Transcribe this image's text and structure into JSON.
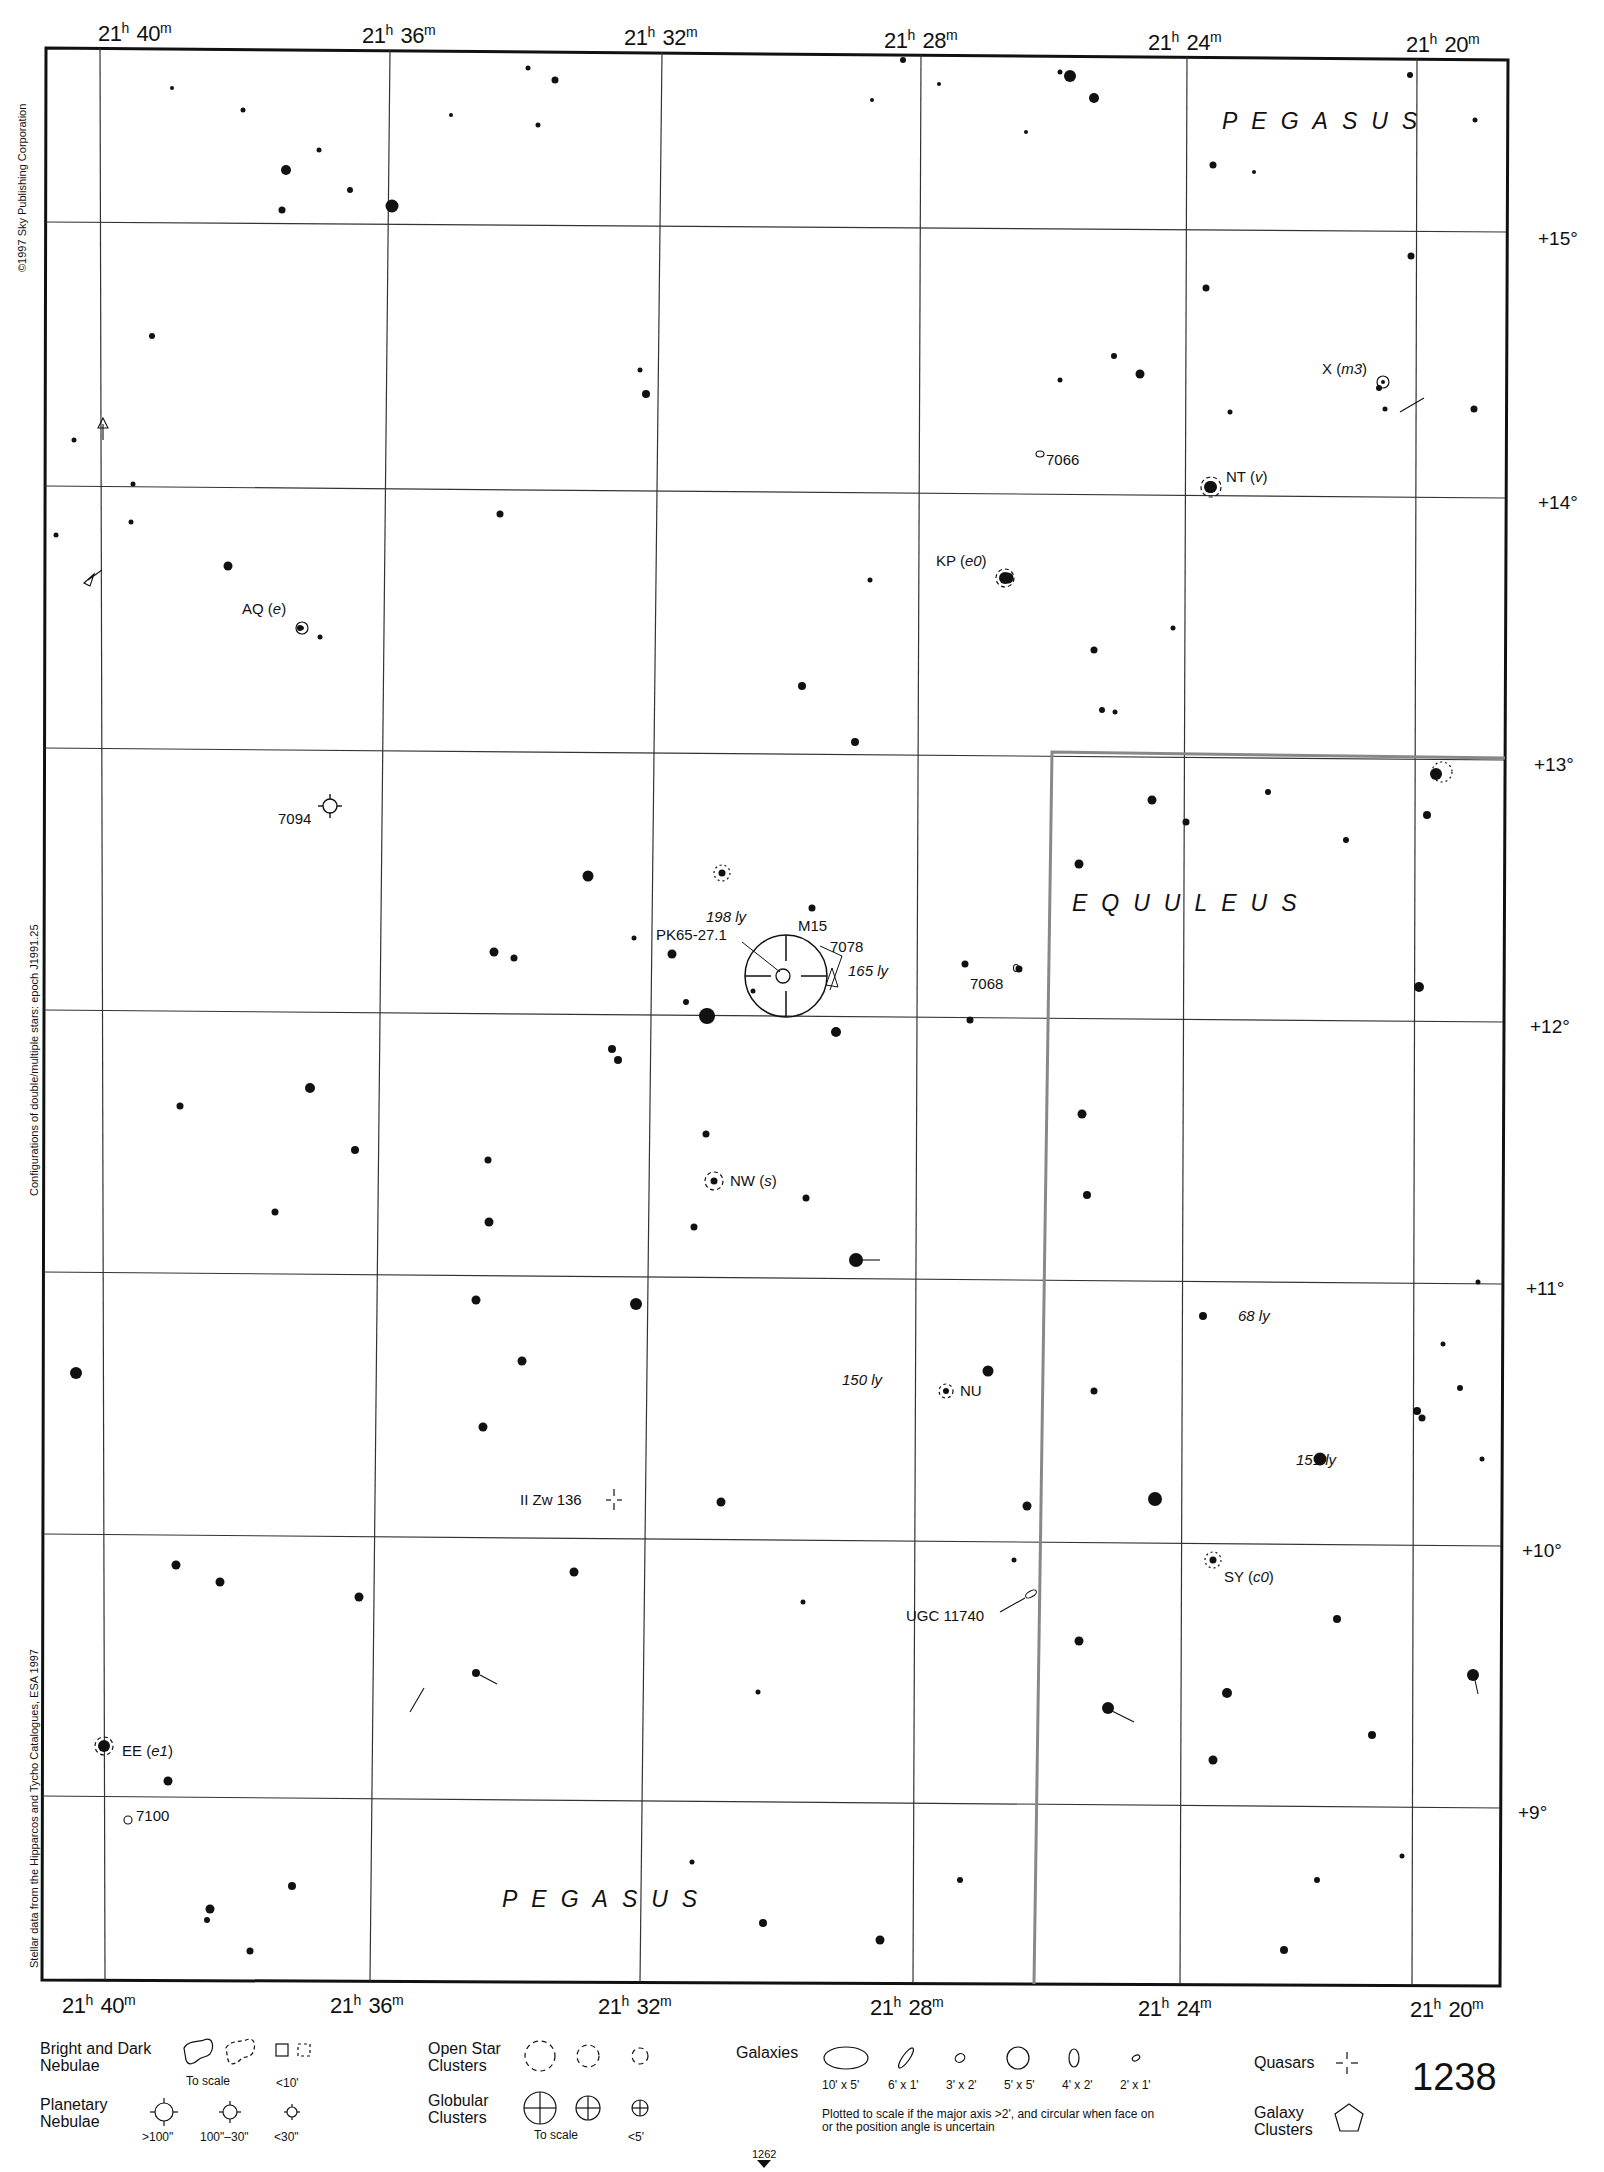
{
  "chart": {
    "page_number": "1238",
    "adjacent_page_bottom": "1262",
    "ra_labels_top": [
      {
        "h": "21",
        "m": "40",
        "x": 98
      },
      {
        "h": "21",
        "m": "36",
        "x": 362
      },
      {
        "h": "21",
        "m": "32",
        "x": 624
      },
      {
        "h": "21",
        "m": "28",
        "x": 884
      },
      {
        "h": "21",
        "m": "24",
        "x": 1148
      },
      {
        "h": "21",
        "m": "20",
        "x": 1406
      }
    ],
    "ra_labels_bottom": [
      {
        "h": "21",
        "m": "40",
        "x": 62
      },
      {
        "h": "21",
        "m": "36",
        "x": 330
      },
      {
        "h": "21",
        "m": "32",
        "x": 598
      },
      {
        "h": "21",
        "m": "28",
        "x": 870
      },
      {
        "h": "21",
        "m": "24",
        "x": 1138
      },
      {
        "h": "21",
        "m": "20",
        "x": 1410
      }
    ],
    "dec_labels": [
      {
        "text": "+15°",
        "y": 228
      },
      {
        "text": "+14°",
        "y": 492
      },
      {
        "text": "+13°",
        "y": 754
      },
      {
        "text": "+12°",
        "y": 1016
      },
      {
        "text": "+11°",
        "y": 1278
      },
      {
        "text": "+10°",
        "y": 1540
      },
      {
        "text": "+9°",
        "y": 1802
      }
    ],
    "side_notes": {
      "copyright": "©1997 Sky Publishing Corporation",
      "configurations": "Configurations of double/multiple stars: epoch J1991.25",
      "stellar_data": "Stellar data from the Hipparcos and Tycho Catalogues, ESA 1997"
    },
    "constellations": [
      {
        "name": "PEGASUS",
        "x": 1222,
        "y": 108
      },
      {
        "name": "EQUULEUS",
        "x": 1072,
        "y": 890
      },
      {
        "name": "PEGASUS",
        "x": 502,
        "y": 1886
      }
    ],
    "objects": [
      {
        "id": "m15",
        "label": "M15",
        "type": "globular-cluster",
        "x": 786,
        "y": 976
      },
      {
        "id": "pk65",
        "label": "PK65-27.1",
        "type": "planetary-nebula",
        "x": 782,
        "y": 976
      },
      {
        "id": "ngc7078",
        "label": "7078"
      },
      {
        "id": "ngc7094",
        "label": "7094",
        "type": "planetary-nebula",
        "x": 330,
        "y": 806
      },
      {
        "id": "ngc7066",
        "label": "7066",
        "type": "galaxy",
        "x": 1040,
        "y": 454
      },
      {
        "id": "ngc7068",
        "label": "7068",
        "type": "galaxy",
        "x": 1016,
        "y": 968
      },
      {
        "id": "ngc7100",
        "label": "7100",
        "type": "galaxy",
        "x": 128,
        "y": 1820
      },
      {
        "id": "ugc11740",
        "label": "UGC 11740",
        "type": "galaxy",
        "x": 1031,
        "y": 1594
      },
      {
        "id": "iizw136",
        "label": "II Zw 136",
        "type": "quasar",
        "x": 614,
        "y": 1500
      }
    ],
    "variable_stars": [
      {
        "name": "AQ",
        "type": "e"
      },
      {
        "name": "X",
        "type": "m3"
      },
      {
        "name": "NT",
        "type": "v"
      },
      {
        "name": "KP",
        "type": "e0"
      },
      {
        "name": "NW",
        "type": "s"
      },
      {
        "name": "NU",
        "type": ""
      },
      {
        "name": "SY",
        "type": "c0"
      },
      {
        "name": "EE",
        "type": "e1"
      }
    ],
    "distances": [
      {
        "text": "198 ly"
      },
      {
        "text": "165 ly"
      },
      {
        "text": "150 ly"
      },
      {
        "text": "68 ly"
      },
      {
        "text": "151 ly"
      }
    ]
  },
  "legend": {
    "nebulae": {
      "title": "Bright and Dark Nebulae",
      "sub_scale": "To scale",
      "sub_small": "<10'"
    },
    "planetary": {
      "title": "Planetary Nebulae",
      "sizes": [
        ">100\"",
        "100\"–30\"",
        "<30\""
      ]
    },
    "open_clusters": {
      "title": "Open Star Clusters"
    },
    "globular": {
      "title": "Globular Clusters",
      "sub_scale": "To scale",
      "sub_small": "<5'"
    },
    "galaxies": {
      "title": "Galaxies",
      "sizes": [
        "10' x 5'",
        "6' x 1'",
        "3' x 2'",
        "5' x 5'",
        "4' x 2'",
        "2' x 1'"
      ],
      "note": "Plotted to scale if the major axis >2', and circular when face on or the position angle is uncertain"
    },
    "quasars": {
      "title": "Quasars"
    },
    "galaxy_clusters": {
      "title": "Galaxy Clusters"
    }
  }
}
